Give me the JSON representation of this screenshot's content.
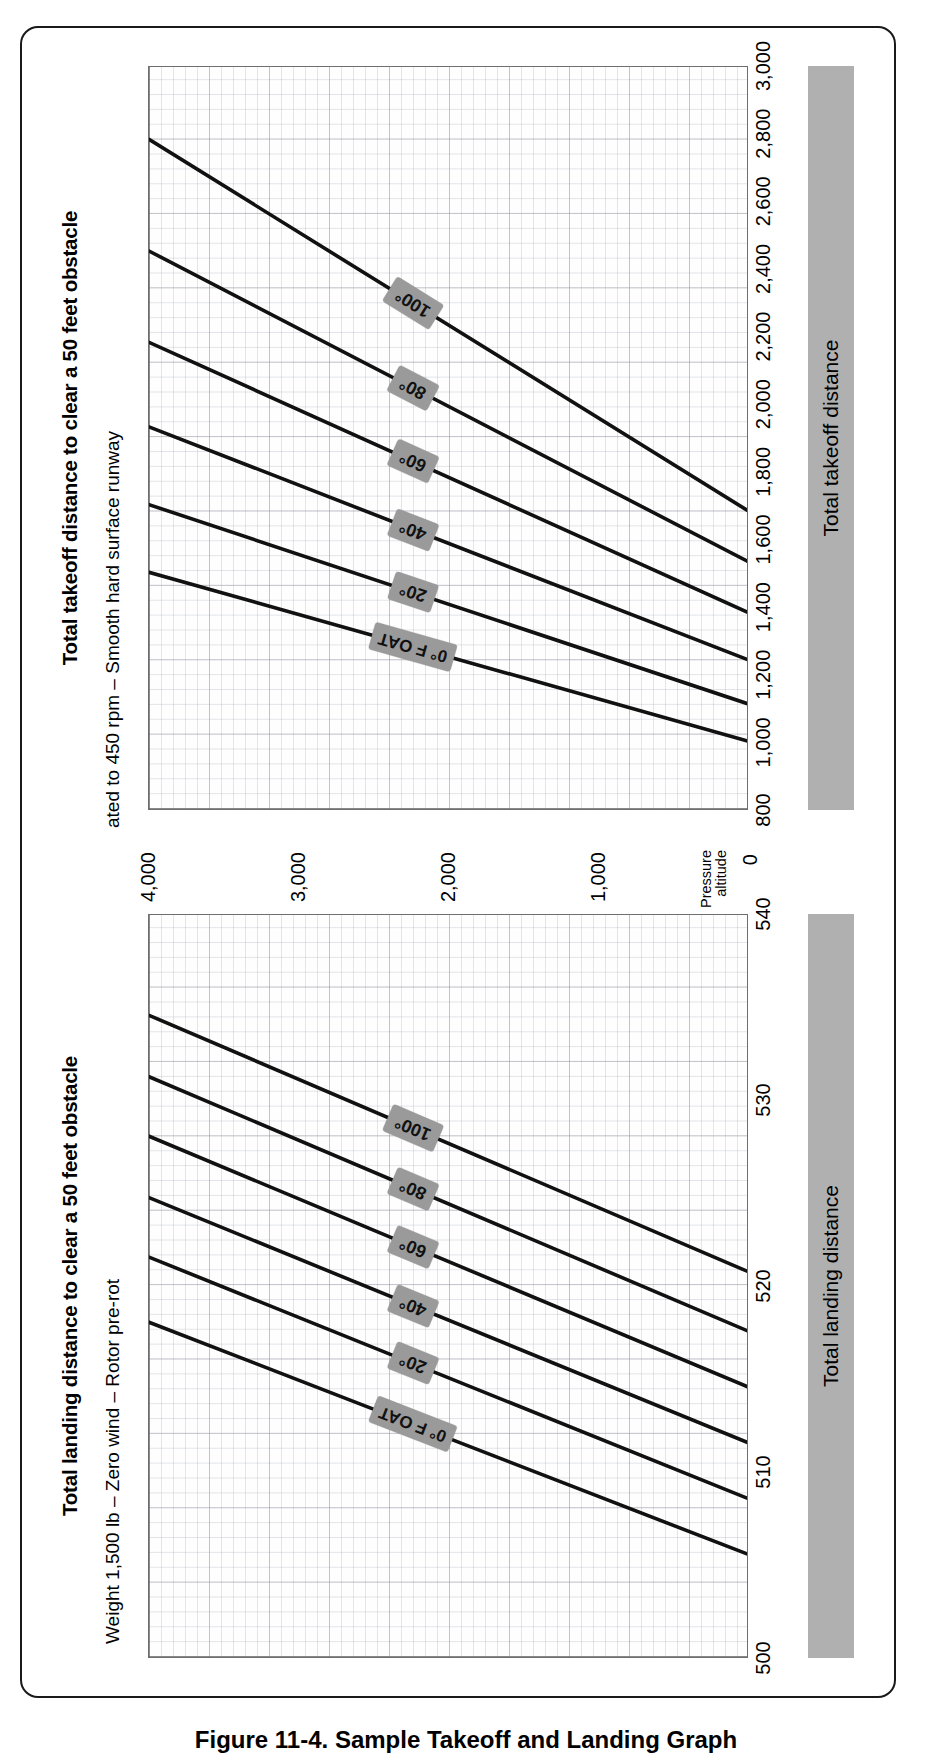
{
  "figure": {
    "caption": "Figure 11-4. Sample Takeoff and Landing Graph"
  },
  "shared": {
    "y_axis_title_line1": "Pressure",
    "y_axis_title_line2": "altitude",
    "y_axis_zero": "0",
    "y_ticks": [
      "4,000",
      "3,000",
      "2,000",
      "1,000"
    ],
    "subtitle": "Weight 1,500 lb – Zero wind – Rotor pre-rotated to 450 rpm – Smooth hard surface runway",
    "subtitle_part_landing": "Weight 1,500 lb – Zero wind – Rotor pre-rot",
    "subtitle_part_takeoff": "ated to 450 rpm – Smooth hard surface runway",
    "oat_labels": [
      "0° F OAT",
      "20°",
      "40°",
      "60°",
      "80°",
      "100°"
    ]
  },
  "panels": [
    {
      "id": "landing",
      "title": "Total landing distance to clear a 50 feet obstacle",
      "axis_band_label": "Total landing distance",
      "x_ticks": [
        "500",
        "510",
        "520",
        "530",
        "540"
      ]
    },
    {
      "id": "takeoff",
      "title": "Total takeoff distance to clear a 50 feet obstacle",
      "axis_band_label": "Total takeoff distance",
      "x_ticks": [
        "800",
        "1,000",
        "1,200",
        "1,400",
        "1,600",
        "1,800",
        "2,000",
        "2,200",
        "2,400",
        "2,600",
        "2,800",
        "3,000"
      ]
    }
  ],
  "colors": {
    "axis_band": "#b0b0b0",
    "oat_label": "#9a9a9a",
    "curve": "#111111",
    "grid_major": "#5a5a5a",
    "frame": "#1a1a1a"
  },
  "chart_data": [
    {
      "type": "line",
      "id": "landing",
      "title": "Total landing distance to clear a 50 feet obstacle",
      "subtitle": "Weight 1,500 lb – Zero wind – Rotor pre-rotated to 450 rpm – Smooth hard surface runway",
      "xlabel": "Total landing distance",
      "ylabel": "Pressure altitude",
      "xlim": [
        500,
        540
      ],
      "ylim": [
        0,
        4000
      ],
      "xticks": [
        500,
        510,
        520,
        530,
        540
      ],
      "yticks": [
        0,
        1000,
        2000,
        3000,
        4000
      ],
      "grid": true,
      "legend": "inline-curve-labels",
      "series": [
        {
          "name": "0° F OAT",
          "x": [
            505.5,
            518.0
          ],
          "y": [
            0,
            4000
          ]
        },
        {
          "name": "20°",
          "x": [
            508.5,
            521.5
          ],
          "y": [
            0,
            4000
          ]
        },
        {
          "name": "40°",
          "x": [
            511.5,
            524.7
          ],
          "y": [
            0,
            4000
          ]
        },
        {
          "name": "60°",
          "x": [
            514.5,
            528.0
          ],
          "y": [
            0,
            4000
          ]
        },
        {
          "name": "80°",
          "x": [
            517.5,
            531.2
          ],
          "y": [
            0,
            4000
          ]
        },
        {
          "name": "100°",
          "x": [
            520.7,
            534.5
          ],
          "y": [
            0,
            4000
          ]
        }
      ]
    },
    {
      "type": "line",
      "id": "takeoff",
      "title": "Total takeoff distance to clear a 50 feet obstacle",
      "subtitle": "Weight 1,500 lb – Zero wind – Rotor pre-rotated to 450 rpm – Smooth hard surface runway",
      "xlabel": "Total takeoff distance",
      "ylabel": "Pressure altitude",
      "xlim": [
        800,
        3000
      ],
      "ylim": [
        0,
        4000
      ],
      "xticks": [
        800,
        1000,
        1200,
        1400,
        1600,
        1800,
        2000,
        2200,
        2400,
        2600,
        2800,
        3000
      ],
      "yticks": [
        0,
        1000,
        2000,
        3000,
        4000
      ],
      "grid": true,
      "legend": "inline-curve-labels",
      "series": [
        {
          "name": "0° F OAT",
          "x": [
            1000,
            1500
          ],
          "y": [
            0,
            4000
          ]
        },
        {
          "name": "20°",
          "x": [
            1110,
            1700
          ],
          "y": [
            0,
            4000
          ]
        },
        {
          "name": "40°",
          "x": [
            1240,
            1930
          ],
          "y": [
            0,
            4000
          ]
        },
        {
          "name": "60°",
          "x": [
            1380,
            2180
          ],
          "y": [
            0,
            4000
          ]
        },
        {
          "name": "80°",
          "x": [
            1530,
            2450
          ],
          "y": [
            0,
            4000
          ]
        },
        {
          "name": "100°",
          "x": [
            1680,
            2780
          ],
          "y": [
            0,
            4000
          ]
        }
      ]
    }
  ]
}
